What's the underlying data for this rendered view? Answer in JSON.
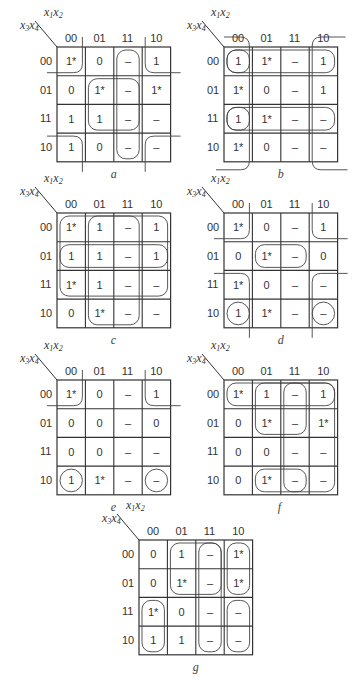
{
  "figure": {
    "row_var_label": {
      "a": "x",
      "a_sub": "3",
      "b": "x",
      "b_sub": "4"
    },
    "col_var_label": {
      "a": "x",
      "a_sub": "1",
      "b": "x",
      "b_sub": "2"
    },
    "col_headers": [
      "00",
      "01",
      "11",
      "10"
    ],
    "row_headers": [
      "00",
      "01",
      "11",
      "10"
    ],
    "dont_care_symbol": "–"
  },
  "maps": [
    {
      "id": "a",
      "caption": "a",
      "origin": [
        57,
        47
      ],
      "cells": [
        [
          "1*",
          "0",
          "–",
          "1"
        ],
        [
          "0",
          "1*",
          "–",
          "1*"
        ],
        [
          "1",
          "1",
          "–",
          "–"
        ],
        [
          "1",
          "0",
          "–",
          "–"
        ]
      ],
      "loops": [
        {
          "type": "rect",
          "r0": 0,
          "c0": 2,
          "r1": 3,
          "c1": 2
        },
        {
          "type": "rect",
          "r0": 1,
          "c0": 1,
          "r1": 2,
          "c1": 2
        },
        {
          "type": "corner",
          "r": 0,
          "c": 0,
          "open": "tl"
        },
        {
          "type": "corner",
          "r": 0,
          "c": 3,
          "open": "tr"
        },
        {
          "type": "corner",
          "r": 3,
          "c": 0,
          "open": "bl"
        },
        {
          "type": "corner",
          "r": 3,
          "c": 3,
          "open": "br"
        }
      ]
    },
    {
      "id": "b",
      "caption": "b",
      "origin": [
        224,
        47
      ],
      "cells": [
        [
          "1",
          "1*",
          "–",
          "1"
        ],
        [
          "1*",
          "0",
          "–",
          "1"
        ],
        [
          "1",
          "1*",
          "–",
          "–"
        ],
        [
          "1*",
          "0",
          "–",
          "–"
        ]
      ],
      "loops": [
        {
          "type": "rect",
          "r0": 0,
          "c0": 0,
          "r1": 0,
          "c1": 0,
          "wrapR": true
        },
        {
          "type": "rect",
          "r0": 2,
          "c0": 0,
          "r1": 2,
          "c1": 0,
          "wrapR": true
        },
        {
          "type": "edgecol",
          "c": 0,
          "side": "left"
        },
        {
          "type": "edgecol",
          "c": 3,
          "side": "right"
        }
      ]
    },
    {
      "id": "c",
      "caption": "c",
      "origin": [
        57,
        213
      ],
      "cells": [
        [
          "1*",
          "1",
          "–",
          "1"
        ],
        [
          "1",
          "1",
          "–",
          "1"
        ],
        [
          "1*",
          "1",
          "–",
          "–"
        ],
        [
          "0",
          "1*",
          "–",
          "–"
        ]
      ],
      "loops": [
        {
          "type": "rect",
          "r0": 0,
          "c0": 0,
          "r1": 2,
          "c1": 3
        },
        {
          "type": "rect",
          "r0": 0,
          "c0": 1,
          "r1": 3,
          "c1": 2
        },
        {
          "type": "rect",
          "r0": 1,
          "c0": 0,
          "r1": 1,
          "c1": 3
        }
      ]
    },
    {
      "id": "d",
      "caption": "d",
      "origin": [
        224,
        213
      ],
      "cells": [
        [
          "1*",
          "0",
          "–",
          "1"
        ],
        [
          "0",
          "1*",
          "–",
          "0"
        ],
        [
          "1*",
          "0",
          "–",
          "–"
        ],
        [
          "1",
          "1*",
          "–",
          "–"
        ]
      ],
      "loops": [
        {
          "type": "rect",
          "r0": 1,
          "c0": 1,
          "r1": 1,
          "c1": 2
        },
        {
          "type": "circle",
          "r": 3,
          "c": 0
        },
        {
          "type": "circle",
          "r": 3,
          "c": 3
        },
        {
          "type": "corner",
          "r": 0,
          "c": 0,
          "open": "tl"
        },
        {
          "type": "corner",
          "r": 0,
          "c": 3,
          "open": "tr"
        },
        {
          "type": "corner",
          "r": 2,
          "c": 0,
          "open": "bl2"
        },
        {
          "type": "corner",
          "r": 2,
          "c": 3,
          "open": "br2"
        }
      ]
    },
    {
      "id": "e",
      "caption": "e",
      "origin": [
        57,
        380
      ],
      "cells": [
        [
          "1*",
          "0",
          "–",
          "1"
        ],
        [
          "0",
          "0",
          "–",
          "0"
        ],
        [
          "0",
          "0",
          "–",
          "–"
        ],
        [
          "1",
          "1*",
          "–",
          "–"
        ]
      ],
      "loops": [
        {
          "type": "corner",
          "r": 0,
          "c": 0,
          "open": "tl"
        },
        {
          "type": "corner",
          "r": 0,
          "c": 3,
          "open": "tr"
        },
        {
          "type": "circle",
          "r": 3,
          "c": 0
        },
        {
          "type": "circle",
          "r": 3,
          "c": 3
        }
      ]
    },
    {
      "id": "f",
      "caption": "f",
      "origin": [
        224,
        380
      ],
      "cells": [
        [
          "1*",
          "1",
          "–",
          "1"
        ],
        [
          "0",
          "1*",
          "–",
          "1*"
        ],
        [
          "0",
          "0",
          "–",
          "–"
        ],
        [
          "0",
          "1*",
          "–",
          "–"
        ]
      ],
      "loops": [
        {
          "type": "rect",
          "r0": 0,
          "c0": 0,
          "r1": 0,
          "c1": 3
        },
        {
          "type": "rect",
          "r0": 0,
          "c0": 1,
          "r1": 1,
          "c1": 2
        },
        {
          "type": "rect",
          "r0": 0,
          "c0": 2,
          "r1": 3,
          "c1": 3
        },
        {
          "type": "rect",
          "r0": 3,
          "c0": 1,
          "r1": 3,
          "c1": 2
        }
      ]
    },
    {
      "id": "g",
      "caption": "g",
      "origin": [
        139,
        540
      ],
      "cells": [
        [
          "0",
          "1",
          "–",
          "1*"
        ],
        [
          "0",
          "1*",
          "–",
          "1*"
        ],
        [
          "1*",
          "0",
          "–",
          "–"
        ],
        [
          "1",
          "1",
          "–",
          "–"
        ]
      ],
      "loops": [
        {
          "type": "rect",
          "r0": 0,
          "c0": 1,
          "r1": 1,
          "c1": 2
        },
        {
          "type": "rect",
          "r0": 0,
          "c0": 2,
          "r1": 3,
          "c1": 2
        },
        {
          "type": "rect",
          "r0": 0,
          "c0": 3,
          "r1": 1,
          "c1": 3
        },
        {
          "type": "rect",
          "r0": 2,
          "c0": 0,
          "r1": 3,
          "c1": 0
        },
        {
          "type": "rect",
          "r0": 2,
          "c0": 3,
          "r1": 3,
          "c1": 3
        }
      ]
    }
  ],
  "chart_data": {
    "type": "table",
    "row_vars": "x3x4",
    "col_vars": "x1x2",
    "col_order": [
      "00",
      "01",
      "11",
      "10"
    ],
    "row_order": [
      "00",
      "01",
      "11",
      "10"
    ],
    "maps": {
      "a": [
        [
          "1*",
          "0",
          "–",
          "1"
        ],
        [
          "0",
          "1*",
          "–",
          "1*"
        ],
        [
          "1",
          "1",
          "–",
          "–"
        ],
        [
          "1",
          "0",
          "–",
          "–"
        ]
      ],
      "b": [
        [
          "1",
          "1*",
          "–",
          "1"
        ],
        [
          "1*",
          "0",
          "–",
          "1"
        ],
        [
          "1",
          "1*",
          "–",
          "–"
        ],
        [
          "1*",
          "0",
          "–",
          "–"
        ]
      ],
      "c": [
        [
          "1*",
          "1",
          "–",
          "1"
        ],
        [
          "1",
          "1",
          "–",
          "1"
        ],
        [
          "1*",
          "1",
          "–",
          "–"
        ],
        [
          "0",
          "1*",
          "–",
          "–"
        ]
      ],
      "d": [
        [
          "1*",
          "0",
          "–",
          "1"
        ],
        [
          "0",
          "1*",
          "–",
          "0"
        ],
        [
          "1*",
          "0",
          "–",
          "–"
        ],
        [
          "1",
          "1*",
          "–",
          "–"
        ]
      ],
      "e": [
        [
          "1*",
          "0",
          "–",
          "1"
        ],
        [
          "0",
          "0",
          "–",
          "0"
        ],
        [
          "0",
          "0",
          "–",
          "–"
        ],
        [
          "1",
          "1*",
          "–",
          "–"
        ]
      ],
      "f": [
        [
          "1*",
          "1",
          "–",
          "1"
        ],
        [
          "0",
          "1*",
          "–",
          "1*"
        ],
        [
          "0",
          "0",
          "–",
          "–"
        ],
        [
          "0",
          "1*",
          "–",
          "–"
        ]
      ],
      "g": [
        [
          "0",
          "1",
          "–",
          "1*"
        ],
        [
          "0",
          "1*",
          "–",
          "1*"
        ],
        [
          "1*",
          "0",
          "–",
          "–"
        ],
        [
          "1",
          "1",
          "–",
          "–"
        ]
      ]
    }
  }
}
